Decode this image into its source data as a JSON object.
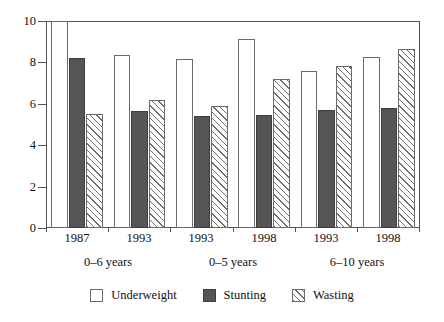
{
  "chart_data": {
    "type": "bar",
    "title": "",
    "subtitle": "",
    "xlabel": "",
    "ylabel": "",
    "ylim": [
      0,
      10
    ],
    "ytick_labels": [
      "0",
      "2",
      "4",
      "6",
      "8",
      "10"
    ],
    "ytick_values": [
      0,
      2,
      4,
      6,
      8,
      10
    ],
    "grid": false,
    "legend_position": "bottom-center",
    "categories": [
      "1987",
      "1993",
      "1993",
      "1998",
      "1993",
      "1998"
    ],
    "group_labels": [
      "0–6 years",
      "0–5 years",
      "6–10 years"
    ],
    "group_spans": [
      2,
      2,
      2
    ],
    "series": [
      {
        "name": "Underweight",
        "color": "#ffffff",
        "pattern": "solid-white",
        "values": [
          10.0,
          8.35,
          8.15,
          9.15,
          7.6,
          8.25
        ]
      },
      {
        "name": "Stunting",
        "color": "#555555",
        "pattern": "solid-gray",
        "values": [
          8.2,
          5.65,
          5.4,
          5.45,
          5.7,
          5.8
        ]
      },
      {
        "name": "Wasting",
        "color": "#6e6e6e",
        "pattern": "diagonal-hatch",
        "values": [
          5.5,
          6.2,
          5.9,
          7.2,
          7.85,
          8.65
        ]
      }
    ]
  },
  "axis": {
    "y_labels": [
      "10",
      "8",
      "6",
      "4",
      "2",
      "0"
    ]
  },
  "x_axis": {
    "year_labels": [
      "1987",
      "1993",
      "1993",
      "1998",
      "1993",
      "1998"
    ],
    "group_labels": [
      "0–6 years",
      "0–5 years",
      "6–10 years"
    ]
  },
  "legend": {
    "items": [
      {
        "label": "Underweight"
      },
      {
        "label": "Stunting"
      },
      {
        "label": "Wasting"
      }
    ]
  }
}
